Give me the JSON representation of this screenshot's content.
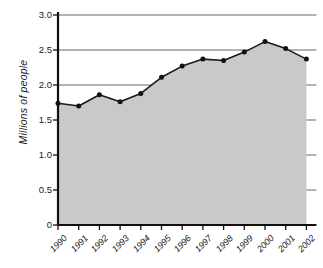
{
  "chart_data": {
    "type": "area",
    "title": "",
    "subtitle": "",
    "xlabel": "",
    "ylabel": "Millions of people",
    "categories": [
      "1990",
      "1991",
      "1992",
      "1993",
      "1994",
      "1995",
      "1996",
      "1997",
      "1998",
      "1999",
      "2000",
      "2001",
      "2002"
    ],
    "values": [
      1.74,
      1.7,
      1.86,
      1.76,
      1.88,
      2.11,
      2.27,
      2.37,
      2.35,
      2.47,
      2.62,
      2.52,
      2.37
    ],
    "series": [
      {
        "name": "Millions of people",
        "values": [
          1.74,
          1.7,
          1.86,
          1.76,
          1.88,
          2.11,
          2.27,
          2.37,
          2.35,
          2.47,
          2.62,
          2.52,
          2.37
        ]
      }
    ],
    "ylim": [
      0,
      3.0
    ],
    "yticks": [
      0,
      0.5,
      1.0,
      1.5,
      2.0,
      2.5,
      3.0
    ],
    "ytick_labels": [
      "0",
      "0.5",
      "1.0",
      "1.5",
      "2.0",
      "2.5",
      "3.0"
    ],
    "grid": true,
    "grid_axis": "y",
    "legend": false,
    "legend_position": "none",
    "marker": "circle",
    "colors": {
      "fill": "#c9c9c9",
      "line": "#1a1a1a",
      "marker": "#111111",
      "grid": "#6b6b6b",
      "axis": "#111111",
      "background": "#ffffff",
      "text": "#1a1a1a"
    }
  }
}
